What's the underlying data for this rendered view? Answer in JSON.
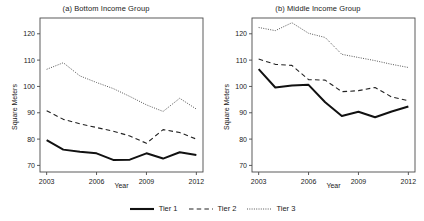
{
  "figure": {
    "legend": {
      "items": [
        {
          "label": "Tier 1",
          "style": "solid",
          "color": "#111111"
        },
        {
          "label": "Tier 2",
          "style": "dashed",
          "color": "#222222"
        },
        {
          "label": "Tier 3",
          "style": "dotted",
          "color": "#555555"
        }
      ]
    }
  },
  "chart_data": [
    {
      "type": "line",
      "title": "(a) Bottom Income Group",
      "xlabel": "Year",
      "ylabel": "Square Meters",
      "x": [
        2003,
        2004,
        2005,
        2006,
        2007,
        2008,
        2009,
        2010,
        2011,
        2012
      ],
      "xlim": [
        2002.6,
        2012.4
      ],
      "xticks": [
        2003,
        2006,
        2009,
        2012
      ],
      "ylim": [
        67.5,
        126
      ],
      "yticks": [
        70,
        80,
        90,
        100,
        110,
        120
      ],
      "grid": false,
      "legend_position": "below-figure",
      "series": [
        {
          "name": "Tier 1",
          "style": "solid",
          "values": [
            79.6,
            76.0,
            75.2,
            74.6,
            72.1,
            72.2,
            74.6,
            72.6,
            75.0,
            74.0
          ]
        },
        {
          "name": "Tier 2",
          "style": "dashed",
          "values": [
            90.8,
            87.5,
            85.8,
            84.4,
            83.0,
            81.2,
            78.4,
            83.6,
            82.5,
            80.0
          ]
        },
        {
          "name": "Tier 3",
          "style": "dotted",
          "values": [
            106.5,
            109.0,
            104.0,
            101.5,
            99.2,
            96.2,
            93.0,
            90.5,
            95.5,
            91.4
          ]
        }
      ]
    },
    {
      "type": "line",
      "title": "(b) Middle Income Group",
      "xlabel": "Year",
      "ylabel": "Square Meters",
      "x": [
        2003,
        2004,
        2005,
        2006,
        2007,
        2008,
        2009,
        2010,
        2011,
        2012
      ],
      "xlim": [
        2002.6,
        2012.4
      ],
      "xticks": [
        2003,
        2006,
        2009,
        2012
      ],
      "ylim": [
        67.5,
        126
      ],
      "yticks": [
        70,
        80,
        90,
        100,
        110,
        120
      ],
      "grid": false,
      "legend_position": "below-figure",
      "series": [
        {
          "name": "Tier 1",
          "style": "solid",
          "values": [
            106.6,
            99.6,
            100.4,
            100.6,
            94.0,
            88.8,
            90.4,
            88.3,
            90.5,
            92.4
          ]
        },
        {
          "name": "Tier 2",
          "style": "dashed",
          "values": [
            110.4,
            108.4,
            108.0,
            102.6,
            102.4,
            98.0,
            98.4,
            99.6,
            96.0,
            94.6
          ]
        },
        {
          "name": "Tier 3",
          "style": "dotted",
          "values": [
            122.4,
            121.2,
            124.2,
            120.2,
            118.6,
            112.2,
            111.0,
            109.8,
            108.4,
            107.2
          ]
        }
      ]
    }
  ]
}
